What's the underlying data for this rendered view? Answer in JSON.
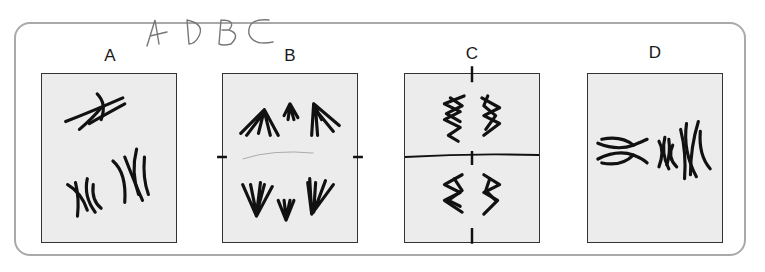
{
  "handwritten_answer": "A D B C",
  "panels": [
    {
      "label": "A",
      "stage": "prophase"
    },
    {
      "label": "B",
      "stage": "anaphase"
    },
    {
      "label": "C",
      "stage": "telophase"
    },
    {
      "label": "D",
      "stage": "metaphase"
    }
  ],
  "colors": {
    "panel_fill": "#ececec",
    "panel_border": "#333333",
    "frame_border": "#a9a9a9",
    "ink": "#111111"
  }
}
